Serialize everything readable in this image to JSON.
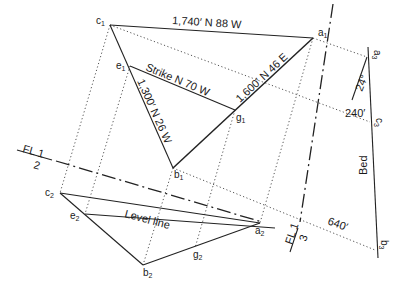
{
  "diagram": {
    "type": "geology three-point problem construction",
    "points": {
      "c1": {
        "label": "c",
        "sub": "1"
      },
      "a1": {
        "label": "a",
        "sub": "1"
      },
      "e1": {
        "label": "e",
        "sub": "1"
      },
      "g1": {
        "label": "g",
        "sub": "1"
      },
      "b1": {
        "label": "b",
        "sub": "1"
      },
      "c2": {
        "label": "c",
        "sub": "2"
      },
      "e2": {
        "label": "e",
        "sub": "2"
      },
      "g2": {
        "label": "g",
        "sub": "2"
      },
      "b2": {
        "label": "b",
        "sub": "2"
      },
      "a2": {
        "label": "a",
        "sub": "2"
      },
      "a3": {
        "label": "a",
        "sub": "3"
      },
      "c3": {
        "label": "c",
        "sub": "3"
      },
      "b3": {
        "label": "b",
        "sub": "3"
      }
    },
    "line_labels": {
      "c1_a1": "1,740′ N 88 W",
      "a1_b1": "1,600′ N 46 E",
      "c1_b1": "1,300′ N 26 W",
      "strike": "Strike N 70 W",
      "level_line": "Level line",
      "bed": "Bed"
    },
    "elevation_labels": {
      "a3_c3": "24°",
      "c3": "240′",
      "b3": "640′"
    },
    "fold_lines": {
      "fl12": {
        "top": "FL 1",
        "bottom": "2"
      },
      "fl13": {
        "top": "FL 1",
        "bottom": "3"
      }
    }
  }
}
